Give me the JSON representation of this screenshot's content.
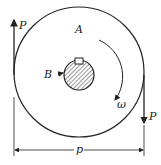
{
  "diagram": {
    "labels": {
      "force_top": "P",
      "force_bottom": "P",
      "pulley": "A",
      "shaft": "B",
      "angular_velocity": "ω",
      "dimension": "p"
    },
    "colors": {
      "stroke": "#222222",
      "background": "#ffffff"
    }
  }
}
